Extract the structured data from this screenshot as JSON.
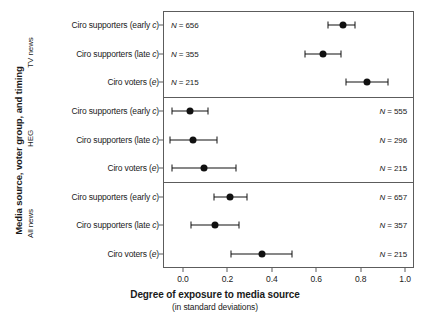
{
  "chart_data": {
    "type": "scatter",
    "title": "",
    "xlabel": "Degree of exposure to media source",
    "xlabel_sub": "(in standard deviations)",
    "ylabel": "Media source, voter group, and timing",
    "xlim": [
      -0.09,
      1.04
    ],
    "ylim": [
      0,
      9
    ],
    "grid": false,
    "legend": null,
    "xticks": [
      "0.0",
      "0.2",
      "0.4",
      "0.6",
      "0.8",
      "1.0"
    ],
    "xtick_values": [
      0.0,
      0.2,
      0.4,
      0.6,
      0.8,
      1.0
    ],
    "panels": [
      {
        "name": "TV news",
        "n_label_side": "left",
        "rows": [
          {
            "label_prefix": "Ciro supporters (early ",
            "label_italic": "c",
            "label_suffix": ")",
            "n_prefix": "N",
            "n_value": " = 656",
            "estimate": 0.72,
            "ci_low": 0.655,
            "ci_high": 0.775
          },
          {
            "label_prefix": "Ciro supporters (late ",
            "label_italic": "c",
            "label_suffix": ")",
            "n_prefix": "N",
            "n_value": " = 355",
            "estimate": 0.63,
            "ci_low": 0.548,
            "ci_high": 0.712
          },
          {
            "label_prefix": "Ciro voters (",
            "label_italic": "e",
            "label_suffix": ")",
            "n_prefix": "N",
            "n_value": " = 215",
            "estimate": 0.83,
            "ci_low": 0.735,
            "ci_high": 0.925
          }
        ]
      },
      {
        "name": "HEG",
        "n_label_side": "right",
        "rows": [
          {
            "label_prefix": "Ciro supporters (early ",
            "label_italic": "c",
            "label_suffix": ")",
            "n_prefix": "N",
            "n_value": " = 555",
            "estimate": 0.03,
            "ci_low": -0.05,
            "ci_high": 0.112
          },
          {
            "label_prefix": "Ciro supporters (late ",
            "label_italic": "c",
            "label_suffix": ")",
            "n_prefix": "N",
            "n_value": " = 296",
            "estimate": 0.045,
            "ci_low": -0.06,
            "ci_high": 0.155
          },
          {
            "label_prefix": "Ciro voters (",
            "label_italic": "e",
            "label_suffix": ")",
            "n_prefix": "N",
            "n_value": " = 215",
            "estimate": 0.095,
            "ci_low": -0.048,
            "ci_high": 0.238
          }
        ]
      },
      {
        "name": "All news",
        "n_label_side": "right",
        "rows": [
          {
            "label_prefix": "Ciro supporters (early ",
            "label_italic": "c",
            "label_suffix": ")",
            "n_prefix": "N",
            "n_value": " = 657",
            "estimate": 0.21,
            "ci_low": 0.138,
            "ci_high": 0.288
          },
          {
            "label_prefix": "Ciro supporters (late ",
            "label_italic": "c",
            "label_suffix": ")",
            "n_prefix": "N",
            "n_value": " = 357",
            "estimate": 0.145,
            "ci_low": 0.035,
            "ci_high": 0.252
          },
          {
            "label_prefix": "Ciro voters (",
            "label_italic": "e",
            "label_suffix": ")",
            "n_prefix": "N",
            "n_value": " = 215",
            "estimate": 0.355,
            "ci_low": 0.215,
            "ci_high": 0.49
          }
        ]
      }
    ],
    "colors": {
      "marker": "#111111",
      "frame": "#5c5c5c",
      "text": "#1a1a1a",
      "background": "#ffffff"
    }
  }
}
